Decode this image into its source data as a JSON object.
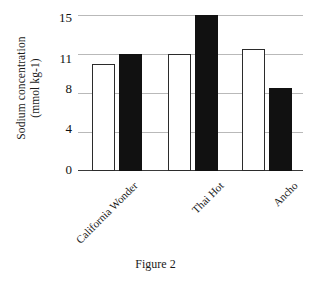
{
  "chart_data": {
    "type": "bar",
    "title": "",
    "subtitle": "",
    "xlabel": "",
    "ylabel": "Sodium concentration (mmol kg-1)",
    "ylabel_line1": "Sodium concentration",
    "ylabel_line2": "(mmol kg-1)",
    "categories": [
      "California Wonder",
      "Thai Hot",
      "Ancho"
    ],
    "series": [
      {
        "name": "open-bar",
        "fill": "#ffffff",
        "values": [
          10.2,
          11.0,
          11.5
        ]
      },
      {
        "name": "filled-bar",
        "fill": "#111111",
        "values": [
          11.0,
          15.0,
          8.4
        ]
      }
    ],
    "y_ticks": [
      0,
      4,
      8,
      11,
      15
    ],
    "y_tick_labels": [
      "0",
      "4",
      "8",
      "11",
      "15"
    ],
    "ylim": [
      0,
      15
    ],
    "grid": true,
    "grid_color": "#b9b9b9",
    "legend": "none",
    "axis_color": "#3a3a3a"
  },
  "caption": "Figure 2"
}
